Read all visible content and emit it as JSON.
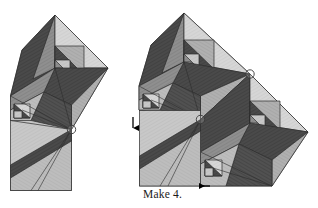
{
  "figure": {
    "caption": "Make 4.",
    "caption_x": 143,
    "caption_y": 188
  },
  "palette": {
    "dark": "#4a4a4a",
    "dark2": "#555555",
    "mid": "#8f8f8f",
    "mid_light": "#b0b0b0",
    "light": "#c8c8c8",
    "light2": "#bdbdbd",
    "pale": "#d6d6d6",
    "outline": "#2b2b2b",
    "background": "#ffffff",
    "marker_stroke": "#3a3a3a",
    "arrow": "#000000"
  },
  "markers": [
    {
      "name": "pivot-circle-left-unit",
      "cx": 71.5,
      "cy": 129.5,
      "r": 4.2
    },
    {
      "name": "pivot-circle-right-upper",
      "cx": 250.0,
      "cy": 74.0,
      "r": 4.2
    },
    {
      "name": "pivot-circle-right-lower",
      "cx": 200.5,
      "cy": 119.5,
      "r": 4.2
    }
  ],
  "arrows": [
    {
      "name": "arrow-down-left-edge",
      "direction": "down",
      "x": 133,
      "y": 117,
      "length": 15
    },
    {
      "name": "arrow-left-bottom-edge",
      "direction": "left",
      "x": 210,
      "y": 186,
      "length": 16
    }
  ],
  "units": [
    {
      "name": "left-unit",
      "label": "single folded block with tail square"
    },
    {
      "name": "right-unit",
      "label": "two folded blocks joined"
    }
  ]
}
